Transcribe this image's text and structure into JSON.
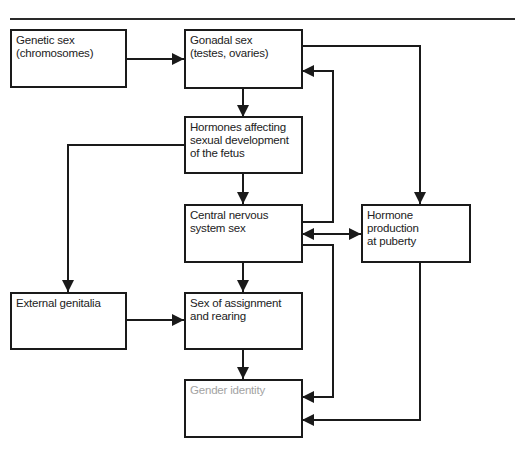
{
  "diagram": {
    "type": "flowchart",
    "nodes": [
      {
        "id": "genetic",
        "label": "Genetic sex\n(chromosomes)"
      },
      {
        "id": "gonadal",
        "label": "Gonadal sex\n(testes, ovaries)"
      },
      {
        "id": "hormones_fetus",
        "label": "Hormones affecting\nsexual development\nof the fetus"
      },
      {
        "id": "cns",
        "label": "Central nervous\nsystem sex"
      },
      {
        "id": "puberty",
        "label": "Hormone\nproduction\nat puberty"
      },
      {
        "id": "genitalia",
        "label": "External genitalia"
      },
      {
        "id": "assignment",
        "label": "Sex of assignment\nand rearing"
      },
      {
        "id": "identity",
        "label": "Gender identity"
      }
    ],
    "edges": [
      {
        "from": "genetic",
        "to": "gonadal"
      },
      {
        "from": "gonadal",
        "to": "hormones_fetus"
      },
      {
        "from": "gonadal",
        "to": "puberty"
      },
      {
        "from": "hormones_fetus",
        "to": "cns"
      },
      {
        "from": "hormones_fetus",
        "to": "genitalia"
      },
      {
        "from": "cns",
        "to": "gonadal"
      },
      {
        "from": "cns",
        "to": "puberty",
        "bidirectional": true
      },
      {
        "from": "cns",
        "to": "assignment"
      },
      {
        "from": "cns",
        "to": "identity"
      },
      {
        "from": "genitalia",
        "to": "assignment"
      },
      {
        "from": "assignment",
        "to": "identity"
      },
      {
        "from": "puberty",
        "to": "identity"
      }
    ],
    "colors": {
      "line": "#1a1a1a",
      "text": "#222222",
      "muted_text": "#a3a3a3"
    }
  }
}
